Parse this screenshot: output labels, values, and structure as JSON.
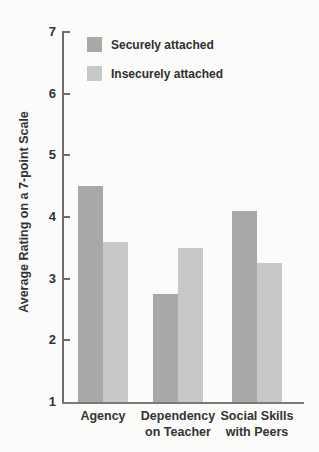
{
  "chart_data": {
    "type": "bar",
    "title": "",
    "ylabel": "Average Rating on a 7-point Scale",
    "xlabel": "",
    "ylim": [
      1,
      7
    ],
    "yticks": [
      1,
      2,
      3,
      4,
      5,
      6,
      7
    ],
    "grid": false,
    "legend_position": "top-left-inside",
    "categories": [
      "Agency",
      "Dependency\non Teacher",
      "Social Skills\nwith Peers"
    ],
    "series": [
      {
        "name": "Securely attached",
        "color": "#a8a8a6",
        "values": [
          4.5,
          2.75,
          4.1
        ]
      },
      {
        "name": "Insecurely attached",
        "color": "#c8c8c6",
        "values": [
          3.6,
          3.5,
          3.25
        ]
      }
    ],
    "axis_color": "#6d6d6b",
    "text_color": "#333333",
    "background": "#fbfbf9"
  }
}
